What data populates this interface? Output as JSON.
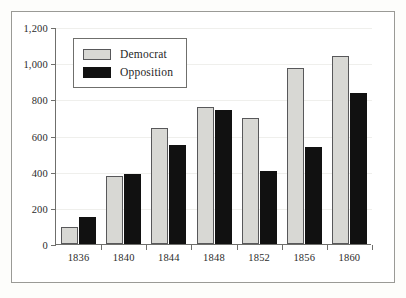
{
  "chart_data": {
    "type": "bar",
    "title": "",
    "subtitle": "",
    "xlabel": "",
    "ylabel": "",
    "categories": [
      "1836",
      "1840",
      "1844",
      "1848",
      "1852",
      "1856",
      "1860"
    ],
    "series": [
      {
        "name": "Democrat",
        "color": "#d8d8d4",
        "values": [
          95,
          375,
          640,
          760,
          695,
          975,
          1040
        ]
      },
      {
        "name": "Opposition",
        "color": "#111111",
        "values": [
          148,
          388,
          545,
          742,
          405,
          535,
          835
        ]
      }
    ],
    "ylim": [
      0,
      1200
    ],
    "yticks": [
      0,
      200,
      400,
      600,
      800,
      1000,
      1200
    ],
    "ytick_labels": [
      "0",
      "200",
      "400",
      "600",
      "800",
      "1,000",
      "1,200"
    ],
    "grid": true,
    "grid_axis": "y",
    "legend": [
      "Democrat",
      "Opposition"
    ],
    "legend_position": "upper-left-inside"
  },
  "legend": {
    "items": [
      {
        "label": "Democrat",
        "swatch": "legend-swatch-democrat"
      },
      {
        "label": "Opposition",
        "swatch": "legend-swatch-opposition"
      }
    ]
  }
}
